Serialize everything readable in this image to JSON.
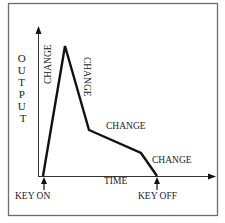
{
  "diagram": {
    "type": "envelope",
    "axes": {
      "y_label": "OUTPUT",
      "x_label": "TIME"
    },
    "events": {
      "key_on": "KEY ON",
      "key_off": "KEY OFF"
    },
    "segments": [
      {
        "label": "CHANGE",
        "stage": "attack"
      },
      {
        "label": "CHANGE",
        "stage": "decay"
      },
      {
        "label": "CHANGE",
        "stage": "sustain"
      },
      {
        "label": "CHANGE",
        "stage": "release"
      }
    ],
    "envelope_points": [
      [
        43,
        176
      ],
      [
        65,
        46
      ],
      [
        89,
        130
      ],
      [
        141,
        153
      ],
      [
        157,
        176
      ]
    ],
    "colors": {
      "line": "#111111",
      "frame": "#6e6e6e",
      "axis": "#333333",
      "background": "#ffffff"
    }
  }
}
